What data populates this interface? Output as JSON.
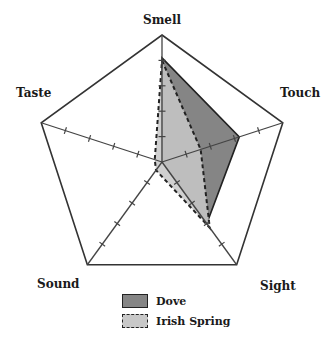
{
  "chart_data": {
    "type": "radar",
    "title": "",
    "axes": [
      "Smell",
      "Touch",
      "Sight",
      "Sound",
      "Taste"
    ],
    "range": [
      0,
      5
    ],
    "ticks": [
      1,
      2,
      3,
      4,
      5
    ],
    "series": [
      {
        "name": "Dove",
        "values": [
          4.1,
          3.2,
          3.0,
          0,
          0
        ],
        "fill": "#858585",
        "stroke": "#222222",
        "line_style": "solid"
      },
      {
        "name": "Irish Spring",
        "values": [
          4.0,
          1.6,
          3.2,
          0.4,
          0.3
        ],
        "fill": "#c8c8c8",
        "stroke": "#222222",
        "line_style": "dashed"
      }
    ],
    "legend_position": "bottom-center"
  },
  "labels": {
    "smell": "Smell",
    "touch": "Touch",
    "sight": "Sight",
    "sound": "Sound",
    "taste": "Taste"
  },
  "legend": {
    "dove": "Dove",
    "irish_spring": "Irish Spring"
  }
}
